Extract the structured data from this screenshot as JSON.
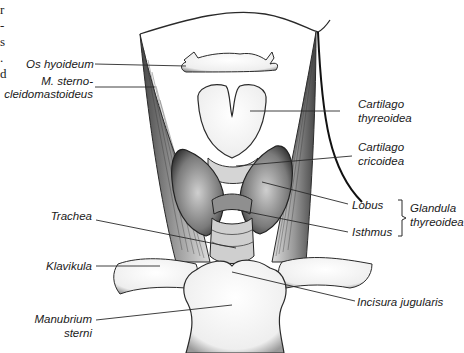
{
  "figure": {
    "edge_text_fragments": [
      "r",
      "-",
      "s",
      ".",
      "d"
    ],
    "labels": {
      "os_hyoideum": "Os hyoideum",
      "m_sterno_line1": "M. sterno-",
      "m_sterno_line2": "cleidomastoideus",
      "cartilago_thyreoidea_line1": "Cartilago",
      "cartilago_thyreoidea_line2": "thyreoidea",
      "cartilago_cricoidea_line1": "Cartilago",
      "cartilago_cricoidea_line2": "cricoidea",
      "lobus": "Lobus",
      "isthmus": "Isthmus",
      "glandula_line1": "Glandula",
      "glandula_line2": "thyreoidea",
      "trachea": "Trachea",
      "klavikula": "Klavikula",
      "incisura_jugularis": "Incisura jugularis",
      "manubrium_line1": "Manubrium",
      "manubrium_line2": "sterni"
    },
    "colors": {
      "line": "#2a2a2a",
      "shade": "#8a8a8a",
      "muscle": "#555555"
    }
  }
}
